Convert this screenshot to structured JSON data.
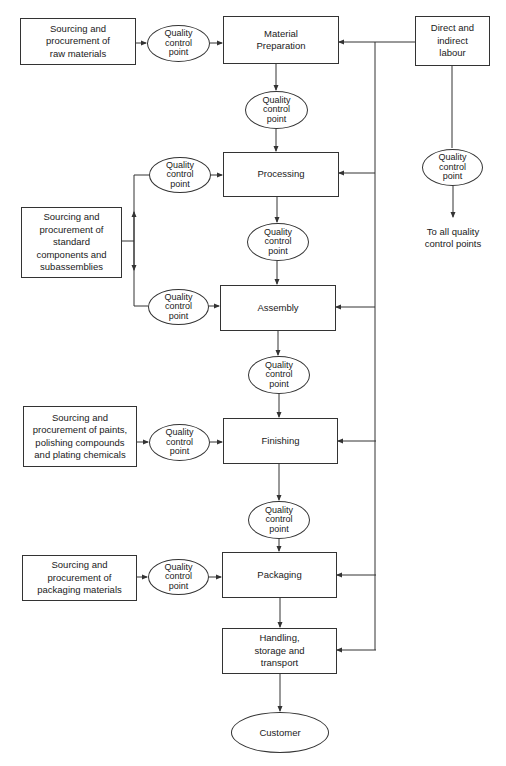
{
  "diagram": {
    "type": "flowchart",
    "qc_label": "Quality\ncontrol\npoint",
    "main_flow": [
      "Material\nPreparation",
      "Processing",
      "Assembly",
      "Finishing",
      "Packaging",
      "Handling,\nstorage and\ntransport"
    ],
    "customer": "Customer",
    "inputs": {
      "raw_materials": "Sourcing and\nprocurement of\nraw materials",
      "standard_components": "Sourcing and\nprocurement of\nstandard\ncomponents and\nsubassemblies",
      "paints": "Sourcing and\nprocurement of paints,\npolishing compounds\nand plating chemicals",
      "packaging_materials": "Sourcing and\nprocurement of\npackaging materials"
    },
    "labour": {
      "box": "Direct and\nindirect\nlabour",
      "note": "To all quality\ncontrol points"
    },
    "colors": {
      "line": "#333333",
      "background": "#ffffff"
    }
  }
}
